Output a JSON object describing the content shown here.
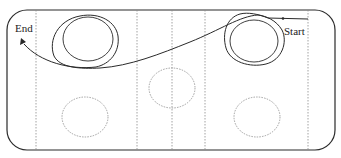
{
  "diagram": {
    "type": "path-trajectory-on-rink",
    "labels": {
      "start": "Start",
      "end": "End"
    },
    "colors": {
      "stroke": "#2a2a2a",
      "dotted": "#8a8a8a",
      "background": "#ffffff"
    },
    "zones": {
      "vertical_lines_count": 5,
      "face_off_circles": [
        {
          "name": "top-left",
          "style": "solid-double"
        },
        {
          "name": "top-right",
          "style": "solid-double"
        },
        {
          "name": "center",
          "style": "dotted"
        },
        {
          "name": "bottom-left",
          "style": "dotted"
        },
        {
          "name": "bottom-right",
          "style": "dotted"
        }
      ]
    }
  }
}
